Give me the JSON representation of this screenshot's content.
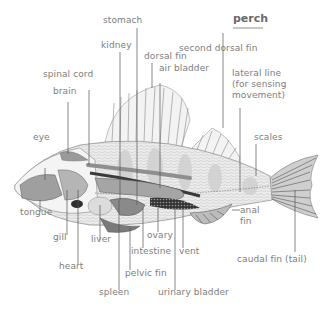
{
  "title": "perch",
  "labels": {
    "stomach": "stomach",
    "second_dorsal_fin": "second dorsal fin",
    "kidney": "kidney",
    "dorsal_fin": "dorsal fin",
    "air_bladder": "air bladder",
    "spinal_cord": "spinal cord",
    "lateral_line": [
      "lateral line",
      "(for sensing",
      "movement)"
    ],
    "brain": "brain",
    "eye": "eye",
    "scales": "scales",
    "tongue": "tongue",
    "gill": "gill",
    "liver": "liver",
    "ovary": "ovary",
    "intestine": "intestine",
    "vent": "vent",
    "anal_fin": [
      "anal",
      "fin"
    ],
    "heart": "heart",
    "pelvic_fin": "pelvic fin",
    "caudal_fin": "caudal fin (tail)",
    "spleen": "spleen",
    "urinary_bladder": "urinary bladder"
  },
  "colors": {
    "label": "#7d7d7d",
    "leader": "#555555",
    "body_fill": "#e6e6e6",
    "organ_fill": "#a9a9a9",
    "dark_organ": "#3a3a3a"
  }
}
